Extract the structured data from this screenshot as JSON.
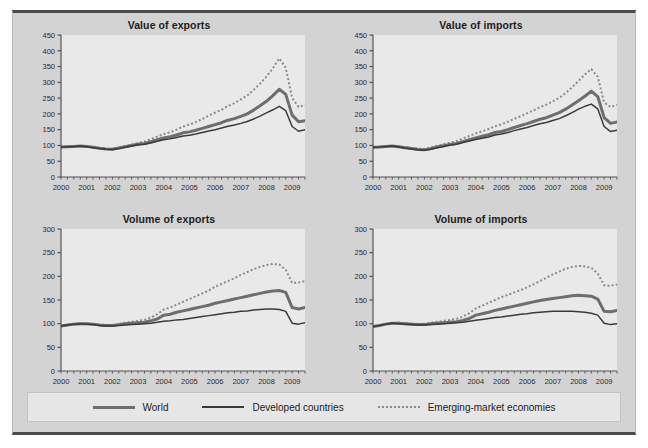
{
  "figure": {
    "background_color": "#d3d3d3",
    "plot_background_color": "#e9e9e9",
    "frame_line_color": "#4b4b4b"
  },
  "legend": {
    "position": "bottom",
    "items": [
      {
        "label": "World",
        "style": "thick-solid",
        "color": "#6e6e6e",
        "icon": "line-swatch-icon"
      },
      {
        "label": "Developed countries",
        "style": "thin-solid",
        "color": "#3a3a3a",
        "icon": "line-swatch-icon"
      },
      {
        "label": "Emerging-market economies",
        "style": "dotted",
        "color": "#8a8a8a",
        "icon": "dotted-line-swatch-icon"
      }
    ]
  },
  "chart_data": [
    {
      "id": "value-of-exports",
      "type": "line",
      "title": "Value of exports",
      "xlabel": "",
      "ylabel": "",
      "xlim": [
        2000.0,
        2009.5
      ],
      "ylim": [
        0,
        450
      ],
      "yticks": [
        0,
        50,
        100,
        150,
        200,
        250,
        300,
        350,
        400,
        450
      ],
      "xticks": [
        2000,
        2001,
        2002,
        2003,
        2004,
        2005,
        2006,
        2007,
        2008,
        2009
      ],
      "xtick_labels": [
        "2000",
        "2001",
        "2002",
        "2003",
        "2004",
        "2005",
        "2006",
        "2007",
        "2008",
        "2009"
      ],
      "grid": false,
      "minor_tick_interval": 0.25,
      "x": [
        2000.0,
        2000.25,
        2000.5,
        2000.75,
        2001.0,
        2001.25,
        2001.5,
        2001.75,
        2002.0,
        2002.25,
        2002.5,
        2002.75,
        2003.0,
        2003.25,
        2003.5,
        2003.75,
        2004.0,
        2004.25,
        2004.5,
        2004.75,
        2005.0,
        2005.25,
        2005.5,
        2005.75,
        2006.0,
        2006.25,
        2006.5,
        2006.75,
        2007.0,
        2007.25,
        2007.5,
        2007.75,
        2008.0,
        2008.25,
        2008.5,
        2008.75,
        2009.0,
        2009.25,
        2009.5
      ],
      "series": [
        {
          "name": "World",
          "color": "#6e6e6e",
          "width": 3.0,
          "dash": "none",
          "values": [
            95,
            96,
            97,
            98,
            97,
            94,
            91,
            89,
            88,
            92,
            96,
            100,
            104,
            106,
            112,
            118,
            124,
            128,
            133,
            140,
            143,
            148,
            154,
            160,
            166,
            172,
            180,
            185,
            192,
            200,
            212,
            226,
            240,
            258,
            278,
            262,
            196,
            175,
            178
          ]
        },
        {
          "name": "Developed countries",
          "color": "#3a3a3a",
          "width": 1.5,
          "dash": "none",
          "values": [
            95,
            96,
            97,
            98,
            96,
            93,
            90,
            88,
            87,
            90,
            94,
            98,
            102,
            104,
            108,
            113,
            118,
            121,
            125,
            130,
            132,
            136,
            141,
            146,
            150,
            155,
            161,
            165,
            170,
            176,
            184,
            193,
            203,
            213,
            224,
            210,
            160,
            145,
            150
          ]
        },
        {
          "name": "Emerging-market economies",
          "color": "#8a8a8a",
          "width": 2.0,
          "dash": "dotted",
          "values": [
            95,
            96,
            97,
            98,
            97,
            95,
            92,
            90,
            89,
            93,
            98,
            103,
            108,
            112,
            120,
            128,
            136,
            142,
            150,
            160,
            166,
            174,
            184,
            194,
            204,
            213,
            225,
            234,
            246,
            258,
            276,
            296,
            318,
            345,
            376,
            346,
            250,
            222,
            228
          ]
        }
      ]
    },
    {
      "id": "value-of-imports",
      "type": "line",
      "title": "Value of imports",
      "xlabel": "",
      "ylabel": "",
      "xlim": [
        2000.0,
        2009.5
      ],
      "ylim": [
        0,
        450
      ],
      "yticks": [
        0,
        50,
        100,
        150,
        200,
        250,
        300,
        350,
        400,
        450
      ],
      "xticks": [
        2000,
        2001,
        2002,
        2003,
        2004,
        2005,
        2006,
        2007,
        2008,
        2009
      ],
      "xtick_labels": [
        "2000",
        "2001",
        "2002",
        "2003",
        "2004",
        "2005",
        "2006",
        "2007",
        "2008",
        "2009"
      ],
      "grid": false,
      "minor_tick_interval": 0.25,
      "x": [
        2000.0,
        2000.25,
        2000.5,
        2000.75,
        2001.0,
        2001.25,
        2001.5,
        2001.75,
        2002.0,
        2002.25,
        2002.5,
        2002.75,
        2003.0,
        2003.25,
        2003.5,
        2003.75,
        2004.0,
        2004.25,
        2004.5,
        2004.75,
        2005.0,
        2005.25,
        2005.5,
        2005.75,
        2006.0,
        2006.25,
        2006.5,
        2006.75,
        2007.0,
        2007.25,
        2007.5,
        2007.75,
        2008.0,
        2008.25,
        2008.5,
        2008.75,
        2009.0,
        2009.25,
        2009.5
      ],
      "series": [
        {
          "name": "World",
          "color": "#6e6e6e",
          "width": 3.0,
          "dash": "none",
          "values": [
            94,
            95,
            97,
            98,
            96,
            93,
            90,
            87,
            86,
            90,
            95,
            99,
            103,
            106,
            112,
            118,
            124,
            129,
            134,
            141,
            144,
            150,
            157,
            163,
            169,
            176,
            183,
            188,
            196,
            204,
            215,
            228,
            242,
            256,
            272,
            255,
            188,
            170,
            174
          ]
        },
        {
          "name": "Developed countries",
          "color": "#3a3a3a",
          "width": 1.5,
          "dash": "none",
          "values": [
            94,
            95,
            97,
            98,
            95,
            92,
            89,
            86,
            85,
            88,
            93,
            97,
            101,
            104,
            109,
            114,
            119,
            123,
            127,
            133,
            136,
            141,
            147,
            152,
            157,
            163,
            169,
            173,
            179,
            185,
            194,
            204,
            215,
            224,
            231,
            216,
            160,
            144,
            148
          ]
        },
        {
          "name": "Emerging-market economies",
          "color": "#8a8a8a",
          "width": 2.0,
          "dash": "dotted",
          "values": [
            94,
            95,
            97,
            98,
            97,
            95,
            92,
            90,
            89,
            94,
            99,
            104,
            109,
            114,
            122,
            130,
            138,
            145,
            152,
            161,
            167,
            175,
            184,
            193,
            202,
            211,
            221,
            229,
            240,
            251,
            266,
            284,
            304,
            325,
            342,
            318,
            236,
            222,
            228
          ]
        }
      ]
    },
    {
      "id": "volume-of-exports",
      "type": "line",
      "title": "Volume of exports",
      "xlabel": "",
      "ylabel": "",
      "xlim": [
        2000.0,
        2009.5
      ],
      "ylim": [
        0,
        300
      ],
      "yticks": [
        0,
        50,
        100,
        150,
        200,
        250,
        300
      ],
      "xticks": [
        2000,
        2001,
        2002,
        2003,
        2004,
        2005,
        2006,
        2007,
        2008,
        2009
      ],
      "xtick_labels": [
        "2000",
        "2001",
        "2002",
        "2003",
        "2004",
        "2005",
        "2006",
        "2007",
        "2008",
        "2009"
      ],
      "grid": false,
      "minor_tick_interval": 0.25,
      "x": [
        2000.0,
        2000.25,
        2000.5,
        2000.75,
        2001.0,
        2001.25,
        2001.5,
        2001.75,
        2002.0,
        2002.25,
        2002.5,
        2002.75,
        2003.0,
        2003.25,
        2003.5,
        2003.75,
        2004.0,
        2004.25,
        2004.5,
        2004.75,
        2005.0,
        2005.25,
        2005.5,
        2005.75,
        2006.0,
        2006.25,
        2006.5,
        2006.75,
        2007.0,
        2007.25,
        2007.5,
        2007.75,
        2008.0,
        2008.25,
        2008.5,
        2008.75,
        2009.0,
        2009.25,
        2009.5
      ],
      "series": [
        {
          "name": "World",
          "color": "#6e6e6e",
          "width": 3.0,
          "dash": "none",
          "values": [
            95,
            97,
            99,
            100,
            100,
            99,
            97,
            96,
            96,
            98,
            100,
            101,
            102,
            103,
            106,
            110,
            118,
            120,
            124,
            127,
            130,
            133,
            136,
            139,
            143,
            146,
            149,
            152,
            155,
            158,
            161,
            164,
            167,
            169,
            170,
            166,
            134,
            131,
            134
          ]
        },
        {
          "name": "Developed countries",
          "color": "#3a3a3a",
          "width": 1.5,
          "dash": "none",
          "values": [
            95,
            97,
            99,
            100,
            99,
            98,
            96,
            95,
            95,
            96,
            97,
            98,
            99,
            100,
            101,
            103,
            105,
            106,
            108,
            109,
            111,
            113,
            115,
            117,
            119,
            121,
            123,
            124,
            126,
            127,
            129,
            130,
            131,
            131,
            130,
            126,
            101,
            99,
            102
          ]
        },
        {
          "name": "Emerging-market economies",
          "color": "#8a8a8a",
          "width": 2.0,
          "dash": "dotted",
          "values": [
            95,
            97,
            99,
            100,
            100,
            99,
            97,
            96,
            97,
            99,
            102,
            104,
            106,
            108,
            113,
            120,
            130,
            134,
            140,
            146,
            152,
            158,
            164,
            170,
            178,
            184,
            190,
            196,
            203,
            209,
            215,
            220,
            224,
            226,
            225,
            214,
            186,
            187,
            190
          ]
        }
      ]
    },
    {
      "id": "volume-of-imports",
      "type": "line",
      "title": "Volume of imports",
      "xlabel": "",
      "ylabel": "",
      "xlim": [
        2000.0,
        2009.5
      ],
      "ylim": [
        0,
        300
      ],
      "yticks": [
        0,
        50,
        100,
        150,
        200,
        250,
        300
      ],
      "xticks": [
        2000,
        2001,
        2002,
        2003,
        2004,
        2005,
        2006,
        2007,
        2008,
        2009
      ],
      "xtick_labels": [
        "2000",
        "2001",
        "2002",
        "2003",
        "2004",
        "2005",
        "2006",
        "2007",
        "2008",
        "2009"
      ],
      "grid": false,
      "minor_tick_interval": 0.25,
      "x": [
        2000.0,
        2000.25,
        2000.5,
        2000.75,
        2001.0,
        2001.25,
        2001.5,
        2001.75,
        2002.0,
        2002.25,
        2002.5,
        2002.75,
        2003.0,
        2003.25,
        2003.5,
        2003.75,
        2004.0,
        2004.25,
        2004.5,
        2004.75,
        2005.0,
        2005.25,
        2005.5,
        2005.75,
        2006.0,
        2006.25,
        2006.5,
        2006.75,
        2007.0,
        2007.25,
        2007.5,
        2007.75,
        2008.0,
        2008.25,
        2008.5,
        2008.75,
        2009.0,
        2009.25,
        2009.5
      ],
      "series": [
        {
          "name": "World",
          "color": "#6e6e6e",
          "width": 3.0,
          "dash": "none",
          "values": [
            94,
            96,
            99,
            101,
            101,
            100,
            99,
            98,
            98,
            100,
            101,
            102,
            103,
            104,
            107,
            111,
            118,
            121,
            124,
            128,
            131,
            134,
            137,
            140,
            143,
            146,
            149,
            151,
            153,
            155,
            157,
            159,
            160,
            159,
            158,
            152,
            126,
            125,
            128
          ]
        },
        {
          "name": "Developed countries",
          "color": "#3a3a3a",
          "width": 1.5,
          "dash": "none",
          "values": [
            94,
            96,
            99,
            101,
            100,
            99,
            98,
            97,
            97,
            98,
            99,
            100,
            101,
            102,
            103,
            105,
            107,
            109,
            111,
            113,
            114,
            116,
            118,
            120,
            121,
            123,
            124,
            125,
            126,
            126,
            126,
            126,
            125,
            124,
            122,
            118,
            101,
            98,
            100
          ]
        },
        {
          "name": "Emerging-market economies",
          "color": "#8a8a8a",
          "width": 2.0,
          "dash": "dotted",
          "values": [
            94,
            96,
            99,
            101,
            102,
            101,
            100,
            99,
            100,
            102,
            104,
            106,
            108,
            110,
            115,
            122,
            132,
            138,
            144,
            150,
            156,
            161,
            166,
            171,
            177,
            183,
            190,
            197,
            204,
            210,
            216,
            220,
            222,
            221,
            218,
            206,
            181,
            180,
            183
          ]
        }
      ]
    }
  ]
}
